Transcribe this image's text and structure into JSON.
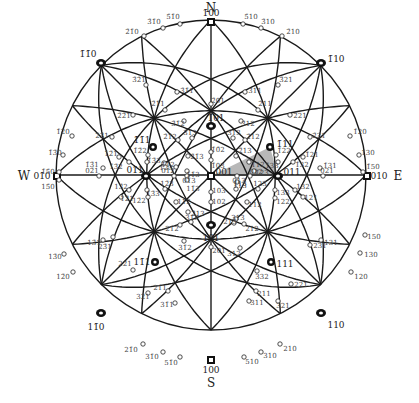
{
  "diagram": {
    "center": [
      211,
      175
    ],
    "radius": 155,
    "colors": {
      "line": "#1a1a1a",
      "triangle": "#b8b8b8",
      "text": "#444444"
    },
    "cardinals": [
      {
        "label": "N",
        "x": 211,
        "y": 8
      },
      {
        "label": "S",
        "x": 211,
        "y": 383
      },
      {
        "label": "W",
        "x": 24,
        "y": 176
      },
      {
        "label": "E",
        "x": 398,
        "y": 176
      }
    ],
    "major_poles": [
      {
        "label": "1̄00",
        "x": 211,
        "y": 22,
        "lx": 211,
        "ly": 13,
        "kind": "square"
      },
      {
        "label": "100",
        "x": 211,
        "y": 360,
        "lx": 211,
        "ly": 370,
        "kind": "square"
      },
      {
        "label": "01̄0",
        "x": 57,
        "y": 176,
        "lx": 42,
        "ly": 176,
        "kind": "square"
      },
      {
        "label": "010",
        "x": 367,
        "y": 176,
        "lx": 379,
        "ly": 176,
        "kind": "square"
      },
      {
        "label": "001",
        "x": 211,
        "y": 176,
        "lx": 224,
        "ly": 172,
        "kind": "square"
      },
      {
        "label": "1̄1̄0",
        "x": 101,
        "y": 63,
        "lx": 88,
        "ly": 54,
        "kind": "oval"
      },
      {
        "label": "1̄10",
        "x": 321,
        "y": 63,
        "lx": 336,
        "ly": 59,
        "kind": "oval"
      },
      {
        "label": "11̄0",
        "x": 101,
        "y": 313,
        "lx": 96,
        "ly": 327,
        "kind": "oval"
      },
      {
        "label": "110",
        "x": 321,
        "y": 313,
        "lx": 336,
        "ly": 325,
        "kind": "oval"
      },
      {
        "label": "1̄01",
        "x": 211,
        "y": 126,
        "lx": 216,
        "ly": 118,
        "kind": "oval"
      },
      {
        "label": "101",
        "x": 211,
        "y": 225,
        "lx": 211,
        "ly": 238,
        "kind": "oval"
      },
      {
        "label": "01̄1",
        "x": 146,
        "y": 176,
        "lx": 135,
        "ly": 170,
        "kind": "oval"
      },
      {
        "label": "011",
        "x": 278,
        "y": 176,
        "lx": 292,
        "ly": 172,
        "kind": "oval"
      },
      {
        "label": "1̄1̄1",
        "x": 153,
        "y": 147,
        "lx": 142,
        "ly": 140,
        "kind": "tri"
      },
      {
        "label": "1̄11",
        "x": 270,
        "y": 147,
        "lx": 285,
        "ly": 144,
        "kind": "tri"
      },
      {
        "label": "11̄1",
        "x": 155,
        "y": 262,
        "lx": 142,
        "ly": 262,
        "kind": "tri"
      },
      {
        "label": "111",
        "x": 271,
        "y": 262,
        "lx": 285,
        "ly": 264,
        "kind": "tri"
      }
    ],
    "minor_poles": [
      {
        "label": "5̄1̄0",
        "x": 180,
        "y": 24,
        "lx": 173,
        "ly": 17
      },
      {
        "label": "3̄1̄0",
        "x": 163,
        "y": 28,
        "lx": 154,
        "ly": 22
      },
      {
        "label": "2̄1̄0",
        "x": 144,
        "y": 36,
        "lx": 132,
        "ly": 32
      },
      {
        "label": "5̄10",
        "x": 243,
        "y": 24,
        "lx": 251,
        "ly": 17
      },
      {
        "label": "3̄10",
        "x": 261,
        "y": 28,
        "lx": 268,
        "ly": 22
      },
      {
        "label": "2̄10",
        "x": 282,
        "y": 36,
        "lx": 293,
        "ly": 32
      },
      {
        "label": "1̄2̄0",
        "x": 72,
        "y": 136,
        "lx": 63,
        "ly": 132
      },
      {
        "label": "1̄3̄0",
        "x": 63,
        "y": 155,
        "lx": 55,
        "ly": 153
      },
      {
        "label": "1̄5̄0",
        "x": 59,
        "y": 172,
        "lx": 48,
        "ly": 172
      },
      {
        "label": "1̄20",
        "x": 350,
        "y": 136,
        "lx": 360,
        "ly": 132
      },
      {
        "label": "1̄30",
        "x": 359,
        "y": 155,
        "lx": 368,
        "ly": 153
      },
      {
        "label": "1̄50",
        "x": 363,
        "y": 172,
        "lx": 373,
        "ly": 167
      },
      {
        "label": "15̄0",
        "x": 59,
        "y": 180,
        "lx": 48,
        "ly": 187
      },
      {
        "label": "13̄0",
        "x": 64,
        "y": 254,
        "lx": 55,
        "ly": 257
      },
      {
        "label": "12̄0",
        "x": 73,
        "y": 272,
        "lx": 63,
        "ly": 277
      },
      {
        "label": "150",
        "x": 365,
        "y": 235,
        "lx": 374,
        "ly": 237
      },
      {
        "label": "130",
        "x": 360,
        "y": 253,
        "lx": 371,
        "ly": 255
      },
      {
        "label": "120",
        "x": 351,
        "y": 272,
        "lx": 361,
        "ly": 277
      },
      {
        "label": "21̄0",
        "x": 143,
        "y": 344,
        "lx": 131,
        "ly": 350
      },
      {
        "label": "31̄0",
        "x": 163,
        "y": 352,
        "lx": 152,
        "ly": 357
      },
      {
        "label": "51̄0",
        "x": 180,
        "y": 357,
        "lx": 171,
        "ly": 363
      },
      {
        "label": "510",
        "x": 244,
        "y": 357,
        "lx": 252,
        "ly": 362
      },
      {
        "label": "310",
        "x": 261,
        "y": 352,
        "lx": 270,
        "ly": 356
      },
      {
        "label": "210",
        "x": 280,
        "y": 344,
        "lx": 290,
        "ly": 349
      },
      {
        "label": "3̄1̄1",
        "x": 177,
        "y": 92,
        "lx": 187,
        "ly": 91
      },
      {
        "label": "3̄11",
        "x": 245,
        "y": 92,
        "lx": 255,
        "ly": 91
      },
      {
        "label": "3̄2̄1",
        "x": 146,
        "y": 85,
        "lx": 139,
        "ly": 80
      },
      {
        "label": "3̄21",
        "x": 278,
        "y": 85,
        "lx": 286,
        "ly": 80
      },
      {
        "label": "2̄1̄1",
        "x": 165,
        "y": 110,
        "lx": 158,
        "ly": 104
      },
      {
        "label": "2̄11",
        "x": 258,
        "y": 110,
        "lx": 265,
        "ly": 104
      },
      {
        "label": "2̄01",
        "x": 211,
        "y": 104,
        "lx": 218,
        "ly": 101
      },
      {
        "label": "3̄1̄2",
        "x": 184,
        "y": 121,
        "lx": 178,
        "ly": 124
      },
      {
        "label": "3̄12",
        "x": 241,
        "y": 121,
        "lx": 248,
        "ly": 124
      },
      {
        "label": "2̄1̄2",
        "x": 178,
        "y": 140,
        "lx": 170,
        "ly": 137
      },
      {
        "label": "2̄12",
        "x": 245,
        "y": 140,
        "lx": 253,
        "ly": 137
      },
      {
        "label": "3̄1̄3",
        "x": 192,
        "y": 138,
        "lx": 190,
        "ly": 133
      },
      {
        "label": "3̄13",
        "x": 233,
        "y": 138,
        "lx": 234,
        "ly": 133
      },
      {
        "label": "2̄1̄3",
        "x": 188,
        "y": 156,
        "lx": 197,
        "ly": 157
      },
      {
        "label": "2̄13",
        "x": 236,
        "y": 156,
        "lx": 245,
        "ly": 151
      },
      {
        "label": "2̄2̄1",
        "x": 133,
        "y": 115,
        "lx": 124,
        "ly": 116
      },
      {
        "label": "2̄21",
        "x": 290,
        "y": 115,
        "lx": 300,
        "ly": 116
      },
      {
        "label": "2̄3̄1",
        "x": 112,
        "y": 137,
        "lx": 102,
        "ly": 136
      },
      {
        "label": "2̄31",
        "x": 310,
        "y": 137,
        "lx": 319,
        "ly": 136
      },
      {
        "label": "1̄2̄1",
        "x": 119,
        "y": 157,
        "lx": 111,
        "ly": 154
      },
      {
        "label": "1̄21",
        "x": 303,
        "y": 157,
        "lx": 312,
        "ly": 155
      },
      {
        "label": "1̄3̄1",
        "x": 103,
        "y": 168,
        "lx": 92,
        "ly": 165
      },
      {
        "label": "1̄31",
        "x": 320,
        "y": 168,
        "lx": 330,
        "ly": 166
      },
      {
        "label": "1̄3̄2",
        "x": 129,
        "y": 162,
        "lx": 116,
        "ly": 167
      },
      {
        "label": "1̄32",
        "x": 293,
        "y": 162,
        "lx": 302,
        "ly": 165
      },
      {
        "label": "1̄2̄2",
        "x": 148,
        "y": 155,
        "lx": 140,
        "ly": 151
      },
      {
        "label": "1̄22",
        "x": 276,
        "y": 155,
        "lx": 284,
        "ly": 151
      },
      {
        "label": "1̄3̄3",
        "x": 147,
        "y": 162,
        "lx": 154,
        "ly": 161
      },
      {
        "label": "1̄33",
        "x": 278,
        "y": 162,
        "lx": 272,
        "ly": 166
      },
      {
        "label": "1̄1̄2",
        "x": 176,
        "y": 167,
        "lx": 168,
        "ly": 165
      },
      {
        "label": "1̄12",
        "x": 249,
        "y": 162,
        "lx": 258,
        "ly": 165
      },
      {
        "label": "1̄2̄3",
        "x": 164,
        "y": 163,
        "lx": 166,
        "ly": 168
      },
      {
        "label": "1̄23",
        "x": 254,
        "y": 171,
        "lx": 262,
        "ly": 173
      },
      {
        "label": "1̄1̄3",
        "x": 187,
        "y": 171,
        "lx": 193,
        "ly": 175
      },
      {
        "label": "1̄13",
        "x": 237,
        "y": 182,
        "lx": 240,
        "ly": 186
      },
      {
        "label": "1̄0̄2",
        "x": 211,
        "y": 152,
        "lx": 218,
        "ly": 150
      },
      {
        "label": "1̄03",
        "x": 211,
        "y": 160,
        "lx": 218,
        "ly": 166
      },
      {
        "label": "02̄1",
        "x": 99,
        "y": 176,
        "lx": 92,
        "ly": 171
      },
      {
        "label": "021",
        "x": 323,
        "y": 176,
        "lx": 327,
        "ly": 171
      },
      {
        "label": "01̄2",
        "x": 174,
        "y": 176,
        "lx": 168,
        "ly": 171
      },
      {
        "label": "012",
        "x": 250,
        "y": 176,
        "lx": 256,
        "ly": 172
      },
      {
        "label": "01̄3",
        "x": 187,
        "y": 176,
        "lx": 189,
        "ly": 181
      },
      {
        "label": "013",
        "x": 237,
        "y": 176,
        "lx": 239,
        "ly": 181
      },
      {
        "label": "103",
        "x": 211,
        "y": 192,
        "lx": 219,
        "ly": 191
      },
      {
        "label": "102",
        "x": 211,
        "y": 202,
        "lx": 219,
        "ly": 202
      },
      {
        "label": "201",
        "x": 211,
        "y": 247,
        "lx": 219,
        "ly": 251
      },
      {
        "label": "1̄3̄3",
        "x": 147,
        "y": 190,
        "lx": 153,
        "ly": 194
      },
      {
        "label": "133",
        "x": 275,
        "y": 190,
        "lx": 283,
        "ly": 193
      },
      {
        "label": "13̄2",
        "x": 129,
        "y": 190,
        "lx": 121,
        "ly": 187
      },
      {
        "label": "132",
        "x": 295,
        "y": 190,
        "lx": 303,
        "ly": 187
      },
      {
        "label": "12̄2",
        "x": 148,
        "y": 197,
        "lx": 139,
        "ly": 201
      },
      {
        "label": "122",
        "x": 275,
        "y": 198,
        "lx": 283,
        "ly": 202
      },
      {
        "label": "12̄3",
        "x": 165,
        "y": 189,
        "lx": 167,
        "ly": 184
      },
      {
        "label": "123",
        "x": 258,
        "y": 189,
        "lx": 260,
        "ly": 184
      },
      {
        "label": "11̄3",
        "x": 187,
        "y": 180,
        "lx": 193,
        "ly": 189
      },
      {
        "label": "113",
        "x": 236,
        "y": 189,
        "lx": 240,
        "ly": 184
      },
      {
        "label": "11̄2",
        "x": 176,
        "y": 202,
        "lx": 184,
        "ly": 202
      },
      {
        "label": "112",
        "x": 247,
        "y": 202,
        "lx": 255,
        "ly": 205
      },
      {
        "label": "13̄1",
        "x": 103,
        "y": 240,
        "lx": 94,
        "ly": 243
      },
      {
        "label": "131",
        "x": 321,
        "y": 240,
        "lx": 331,
        "ly": 243
      },
      {
        "label": "12̄1",
        "x": 121,
        "y": 197,
        "lx": 127,
        "ly": 199
      },
      {
        "label": "121",
        "x": 303,
        "y": 197,
        "lx": 311,
        "ly": 198
      },
      {
        "label": "23̄1",
        "x": 113,
        "y": 237,
        "lx": 105,
        "ly": 247
      },
      {
        "label": "231",
        "x": 310,
        "y": 245,
        "lx": 320,
        "ly": 246
      },
      {
        "label": "22̄1",
        "x": 133,
        "y": 270,
        "lx": 125,
        "ly": 264
      },
      {
        "label": "221",
        "x": 291,
        "y": 284,
        "lx": 301,
        "ly": 285
      },
      {
        "label": "32̄1",
        "x": 148,
        "y": 293,
        "lx": 143,
        "ly": 297
      },
      {
        "label": "321",
        "x": 278,
        "y": 301,
        "lx": 283,
        "ly": 306
      },
      {
        "label": "2̄13",
        "x": 188,
        "y": 212,
        "lx": 198,
        "ly": 214
      },
      {
        "label": "213",
        "x": 236,
        "y": 219,
        "lx": 230,
        "ly": 222
      },
      {
        "label": "31̄3",
        "x": 191,
        "y": 222,
        "lx": 192,
        "ly": 218
      },
      {
        "label": "313",
        "x": 234,
        "y": 223,
        "lx": 238,
        "ly": 218
      },
      {
        "label": "21̄2",
        "x": 180,
        "y": 225,
        "lx": 172,
        "ly": 229
      },
      {
        "label": "212",
        "x": 244,
        "y": 224,
        "lx": 252,
        "ly": 229
      },
      {
        "label": "332",
        "x": 257,
        "y": 271,
        "lx": 262,
        "ly": 277
      },
      {
        "label": "21̄1",
        "x": 168,
        "y": 291,
        "lx": 160,
        "ly": 288
      },
      {
        "label": "211",
        "x": 256,
        "y": 291,
        "lx": 264,
        "ly": 294
      },
      {
        "label": "31̄2",
        "x": 184,
        "y": 241,
        "lx": 185,
        "ly": 248
      },
      {
        "label": "312",
        "x": 240,
        "y": 248,
        "lx": 234,
        "ly": 254
      },
      {
        "label": "31̄1",
        "x": 175,
        "y": 303,
        "lx": 167,
        "ly": 305
      },
      {
        "label": "311",
        "x": 249,
        "y": 301,
        "lx": 257,
        "ly": 303
      }
    ],
    "shaded_triangle": [
      [
        211,
        176
      ],
      [
        270,
        147
      ],
      [
        278,
        176
      ]
    ]
  }
}
